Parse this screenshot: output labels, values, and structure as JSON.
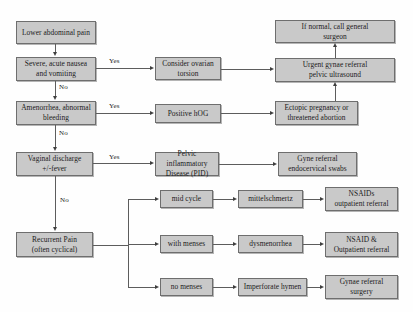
{
  "diagram": {
    "colors": {
      "node_fill": "#c9c9c9",
      "node_border": "#6e6e6e",
      "edge": "#5d5d5d",
      "background": "#fefefe",
      "text": "#1b1b1b"
    },
    "nodes": [
      {
        "id": "lower_abdominal_pain",
        "label": "Lower abdominal pain"
      },
      {
        "id": "severe_nausea",
        "label": "Severe, acute nausea\nand vomiting"
      },
      {
        "id": "amenorrhea",
        "label": "Amenorrhea, abnormal\nbleeding"
      },
      {
        "id": "vaginal_discharge",
        "label": "Vaginal discharge\n+/-fever"
      },
      {
        "id": "recurrent_pain",
        "label": "Recurrent Pain\n(often cyclical)"
      },
      {
        "id": "consider_ovarian_torsion",
        "label": "Consider ovarian\ntorsion"
      },
      {
        "id": "positive_hcg",
        "label": "Positive hOG"
      },
      {
        "id": "pid",
        "label": "Pelvic inflammatory\nDisease (PID)"
      },
      {
        "id": "mid_cycle",
        "label": "mid cycle"
      },
      {
        "id": "with_menses",
        "label": "with menses"
      },
      {
        "id": "no_menses",
        "label": "no menses"
      },
      {
        "id": "mittelschmertz",
        "label": "mittelschmertz"
      },
      {
        "id": "dysmenorrhea",
        "label": "dysmenorrhea"
      },
      {
        "id": "imperforate_hymen",
        "label": "Imperforate hymen"
      },
      {
        "id": "if_normal_call_general_surgeon",
        "label": "If normal, call general\nsurgeon"
      },
      {
        "id": "urgent_gynae_referral",
        "label": "Urgent gynae referral\npelvic ultrasound"
      },
      {
        "id": "ectopic_pregnancy",
        "label": "Ectopic pregnancy or\nthreatened abortion"
      },
      {
        "id": "gyne_referral_swabs",
        "label": "Gyne referral\nendocervical swabs"
      },
      {
        "id": "nsaids_outpatient_referral",
        "label": "NSAIDs\noutpatient referral"
      },
      {
        "id": "nsaid_outpatient_referral",
        "label": "NSAID &\nOutpatient referral"
      },
      {
        "id": "gynae_referral_surgery",
        "label": "Gynae referral\nsurgery"
      }
    ],
    "edge_labels": {
      "yes_1": "Yes",
      "yes_2": "Yes",
      "yes_3": "Yes",
      "no_1": "No",
      "no_2": "No",
      "no_3": "No"
    }
  }
}
